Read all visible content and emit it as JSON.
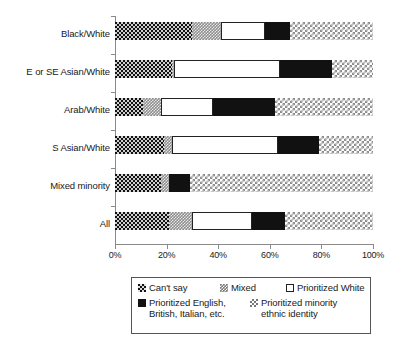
{
  "chart_data": {
    "type": "bar",
    "orientation": "horizontal",
    "stacked": true,
    "normalized_percent": true,
    "title": "",
    "subtitle": "",
    "xlabel": "",
    "ylabel": "",
    "xlim": [
      0,
      100
    ],
    "grid": false,
    "legend_position": "bottom",
    "xticks": [
      "0%",
      "20%",
      "40%",
      "60%",
      "80%",
      "100%"
    ],
    "xtick_values": [
      0,
      20,
      40,
      60,
      80,
      100
    ],
    "categories": [
      "Black/White",
      "E or SE Asian/White",
      "Arab/White",
      "S Asian/White",
      "Mixed minority",
      "All"
    ],
    "series": [
      {
        "name": "Can't say",
        "pattern": "dark-checkerboard",
        "values": [
          30,
          22,
          11,
          19,
          18,
          21
        ]
      },
      {
        "name": "Mixed",
        "pattern": "grey-speckle",
        "values": [
          11,
          1,
          7,
          3,
          3,
          9
        ]
      },
      {
        "name": "Prioritized White",
        "pattern": "white-outline",
        "values": [
          17,
          41,
          20,
          41,
          0,
          23
        ]
      },
      {
        "name": "Prioritized English, British, Italian, etc.",
        "pattern": "solid-black",
        "values": [
          10,
          20,
          24,
          16,
          8,
          13
        ]
      },
      {
        "name": "Prioritized minority ethnic identity",
        "pattern": "light-checkerboard",
        "values": [
          32,
          16,
          38,
          21,
          71,
          34
        ]
      }
    ]
  },
  "legend": {
    "entries": [
      {
        "label": "Can't say",
        "swatch": "dark-checkerboard-swatch"
      },
      {
        "label": "Mixed",
        "swatch": "grey-speckle-swatch"
      },
      {
        "label": "Prioritized White",
        "swatch": "white-outline-swatch"
      },
      {
        "label": "Prioritized English,\nBritish, Italian, etc.",
        "swatch": "solid-black-swatch"
      },
      {
        "label": "Prioritized minority\nethnic identity",
        "swatch": "light-checkerboard-swatch"
      }
    ]
  }
}
